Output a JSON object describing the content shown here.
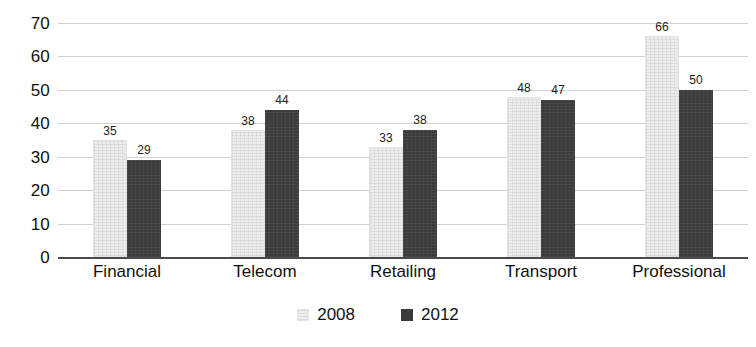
{
  "chart_data": {
    "type": "bar",
    "title": "",
    "subtitle": "",
    "xlabel": "",
    "ylabel": "",
    "categories": [
      "Financial",
      "Telecom",
      "Retailing",
      "Transport",
      "Professional"
    ],
    "series": [
      {
        "name": "2008",
        "values": [
          35,
          38,
          33,
          48,
          66
        ],
        "color": "#ededed"
      },
      {
        "name": "2012",
        "values": [
          29,
          44,
          38,
          47,
          50
        ],
        "color": "#3b3b3b"
      }
    ],
    "ylim": [
      0,
      70
    ],
    "yticks": [
      70,
      60,
      50,
      40,
      30,
      20,
      10,
      0
    ],
    "ytick_labels": [
      "70",
      "60",
      "50",
      "40",
      "30",
      "20",
      "10",
      "0"
    ],
    "grid": true,
    "grid_axis": "y",
    "data_labels": true,
    "legend_position": "bottom",
    "legend_entries": [
      {
        "label": "2008",
        "swatch": "light"
      },
      {
        "label": "2012",
        "swatch": "dark"
      }
    ],
    "bars": [
      {
        "category": "Financial",
        "year": "2008",
        "value": 35,
        "label": "35",
        "style": "light"
      },
      {
        "category": "Financial",
        "year": "2012",
        "value": 29,
        "label": "29",
        "style": "dark"
      },
      {
        "category": "Telecom",
        "year": "2008",
        "value": 38,
        "label": "38",
        "style": "light"
      },
      {
        "category": "Telecom",
        "year": "2012",
        "value": 44,
        "label": "44",
        "style": "dark"
      },
      {
        "category": "Retailing",
        "year": "2008",
        "value": 33,
        "label": "33",
        "style": "light"
      },
      {
        "category": "Retailing",
        "year": "2012",
        "value": 38,
        "label": "38",
        "style": "dark"
      },
      {
        "category": "Transport",
        "year": "2008",
        "value": 48,
        "label": "48",
        "style": "light"
      },
      {
        "category": "Transport",
        "year": "2012",
        "value": 47,
        "label": "47",
        "style": "dark"
      },
      {
        "category": "Professional",
        "year": "2008",
        "value": 66,
        "label": "66",
        "style": "light"
      },
      {
        "category": "Professional",
        "year": "2012",
        "value": 50,
        "label": "50",
        "style": "dark"
      }
    ],
    "colors": {
      "series_2008": "#ededed",
      "series_2012": "#3b3b3b",
      "gridline": "#c9c9c9",
      "axis": "#4a4a4a",
      "text": "#111111",
      "background": "#ffffff"
    }
  }
}
